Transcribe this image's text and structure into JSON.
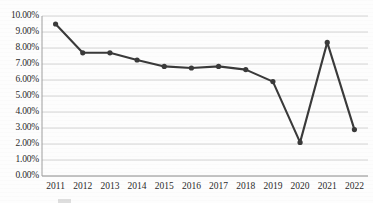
{
  "chart_data": {
    "type": "line",
    "title": "",
    "subtitle": "",
    "xlabel": "",
    "ylabel": "",
    "categories": [
      "2011",
      "2012",
      "2013",
      "2014",
      "2015",
      "2016",
      "2017",
      "2018",
      "2019",
      "2020",
      "2021",
      "2022"
    ],
    "values": [
      9.5,
      7.7,
      7.7,
      7.25,
      6.85,
      6.75,
      6.85,
      6.65,
      5.9,
      2.1,
      8.35,
      2.9
    ],
    "series": [
      {
        "name": "",
        "values": [
          9.5,
          7.7,
          7.7,
          7.25,
          6.85,
          6.75,
          6.85,
          6.65,
          5.9,
          2.1,
          8.35,
          2.9
        ]
      }
    ],
    "ylim": [
      0,
      10
    ],
    "ytick_values": [
      0,
      1,
      2,
      3,
      4,
      5,
      6,
      7,
      8,
      9,
      10
    ],
    "ytick_labels": [
      "0.00%",
      "1.00%",
      "2.00%",
      "3.00%",
      "4.00%",
      "5.00%",
      "6.00%",
      "7.00%",
      "8.00%",
      "9.00%",
      "10.00%"
    ],
    "xtick_labels": [
      "2011",
      "2012",
      "2013",
      "2014",
      "2015",
      "2016",
      "2017",
      "2018",
      "2019",
      "2020",
      "2021",
      "2022"
    ],
    "grid": "horizontal",
    "legend_position": "bottom",
    "marker": "circle",
    "colors": {
      "line": "#3a3a3a",
      "marker": "#3a3a3a",
      "grid": "#c9c9c9",
      "axis": "#9e9e9e",
      "text": "#2b2b2b",
      "background": "#fdfdfd"
    }
  },
  "legend": {
    "entry_label": ""
  }
}
